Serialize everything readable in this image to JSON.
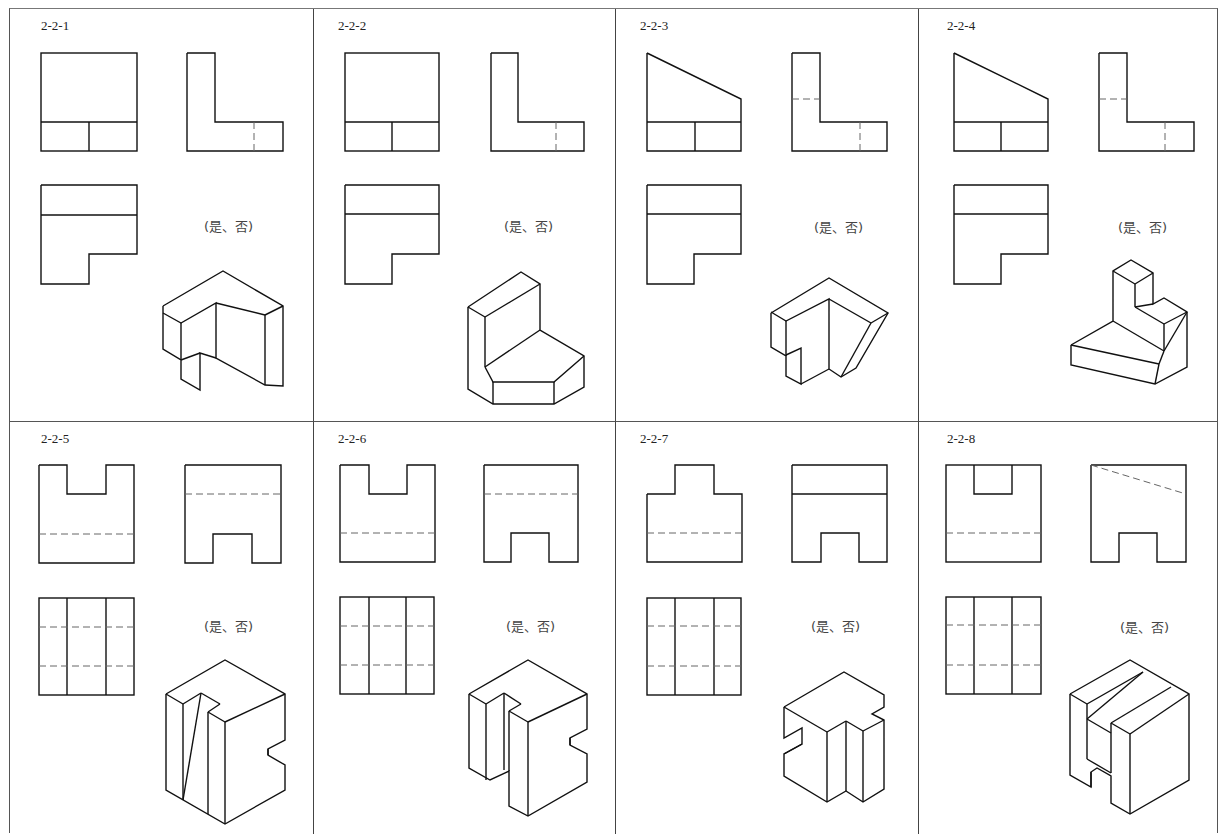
{
  "worksheet": {
    "title": "Three-view drawing vs. isometric view matching exercise",
    "answer_prompt": "(是、否)",
    "problems": [
      {
        "id": "2-2-1",
        "answer_label": "(是、否)"
      },
      {
        "id": "2-2-2",
        "answer_label": "(是、否)"
      },
      {
        "id": "2-2-3",
        "answer_label": "(是、否)"
      },
      {
        "id": "2-2-4",
        "answer_label": "(是、否)"
      },
      {
        "id": "2-2-5",
        "answer_label": "(是、否)"
      },
      {
        "id": "2-2-6",
        "answer_label": "(是、否)"
      },
      {
        "id": "2-2-7",
        "answer_label": "(是、否)"
      },
      {
        "id": "2-2-8",
        "answer_label": "(是、否)"
      }
    ]
  },
  "colors": {
    "line": "#111111",
    "hidden_line": "#666666",
    "frame": "#555555",
    "background": "#ffffff"
  }
}
